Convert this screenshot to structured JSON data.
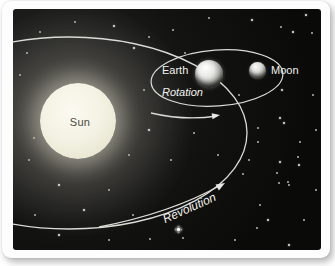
{
  "scene": {
    "title": "Sun, Earth and Moon orbital diagram",
    "labels": {
      "sun": "Sun",
      "earth": "Earth",
      "moon": "Moon",
      "rotation": "Rotation",
      "revolution": "Revolution"
    },
    "colors": {
      "sky": "#0a0a09",
      "orbit_line": "#dcdcd7",
      "sun_fill": "#f4f2e3",
      "sun_label_text": "#4b4b43",
      "light_label_text": "#f2f2ee",
      "card_background": "#fdfdfd"
    },
    "stars": [
      [
        61,
        12,
        1
      ],
      [
        100,
        16,
        2
      ],
      [
        159,
        20,
        1
      ],
      [
        195,
        8,
        1
      ],
      [
        238,
        10,
        2
      ],
      [
        267,
        17,
        1
      ],
      [
        292,
        5,
        2
      ],
      [
        26,
        22,
        1
      ],
      [
        135,
        27,
        1
      ],
      [
        279,
        22,
        2
      ],
      [
        298,
        23,
        1
      ],
      [
        13,
        43,
        1
      ],
      [
        120,
        38,
        2
      ],
      [
        171,
        43,
        1
      ],
      [
        6,
        65,
        1
      ],
      [
        130,
        80,
        1
      ],
      [
        225,
        85,
        1
      ],
      [
        268,
        80,
        2
      ],
      [
        299,
        85,
        1
      ],
      [
        20,
        128,
        1
      ],
      [
        135,
        120,
        2
      ],
      [
        180,
        123,
        1
      ],
      [
        244,
        118,
        1
      ],
      [
        270,
        113,
        2
      ],
      [
        302,
        120,
        1
      ],
      [
        266,
        108,
        2
      ],
      [
        244,
        132,
        1
      ],
      [
        286,
        132,
        1
      ],
      [
        284,
        147,
        1
      ],
      [
        266,
        152,
        2
      ],
      [
        263,
        163,
        1
      ],
      [
        265,
        173,
        1
      ],
      [
        274,
        172,
        1
      ],
      [
        229,
        164,
        1
      ],
      [
        15,
        150,
        1
      ],
      [
        115,
        145,
        1
      ],
      [
        157,
        150,
        1
      ],
      [
        204,
        145,
        1
      ],
      [
        235,
        150,
        1
      ],
      [
        285,
        155,
        2
      ],
      [
        45,
        175,
        2
      ],
      [
        95,
        180,
        1
      ],
      [
        275,
        175,
        1
      ],
      [
        302,
        180,
        1
      ],
      [
        21,
        205,
        1
      ],
      [
        70,
        200,
        2
      ],
      [
        119,
        205,
        1
      ],
      [
        246,
        195,
        1
      ],
      [
        254,
        210,
        2
      ],
      [
        290,
        210,
        1
      ],
      [
        164,
        219,
        3
      ],
      [
        45,
        225,
        2
      ],
      [
        95,
        230,
        1
      ],
      [
        136,
        229,
        1
      ],
      [
        169,
        228,
        1
      ],
      [
        221,
        230,
        1
      ],
      [
        275,
        235,
        2
      ],
      [
        243,
        218,
        1
      ]
    ]
  }
}
